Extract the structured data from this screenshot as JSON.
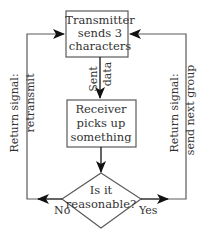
{
  "diagram": {
    "type": "flowchart",
    "colors": {
      "stroke": "#5a5a5a",
      "text": "#333333",
      "arrow": "#111111",
      "background": "#ffffff"
    },
    "nodes": {
      "transmitter": {
        "shape": "rectangle",
        "lines": [
          "Transmitter",
          "sends 3",
          "characters"
        ]
      },
      "receiver": {
        "shape": "rectangle",
        "lines": [
          "Receiver",
          "picks up",
          "something"
        ]
      },
      "decision": {
        "shape": "diamond",
        "lines": [
          "Is it",
          "reasonable?"
        ]
      }
    },
    "edges": {
      "sent_data": {
        "from": "transmitter",
        "to": "receiver",
        "label_lines": [
          "Sent",
          "data"
        ]
      },
      "to_decision": {
        "from": "receiver",
        "to": "decision"
      },
      "no_branch": {
        "from": "decision",
        "to": "transmitter",
        "branch_label": "No",
        "label_lines": [
          "Return signal:",
          "retransmit"
        ]
      },
      "yes_branch": {
        "from": "decision",
        "to": "transmitter",
        "branch_label": "Yes",
        "label_lines": [
          "Return signal:",
          "send next group"
        ]
      }
    }
  }
}
